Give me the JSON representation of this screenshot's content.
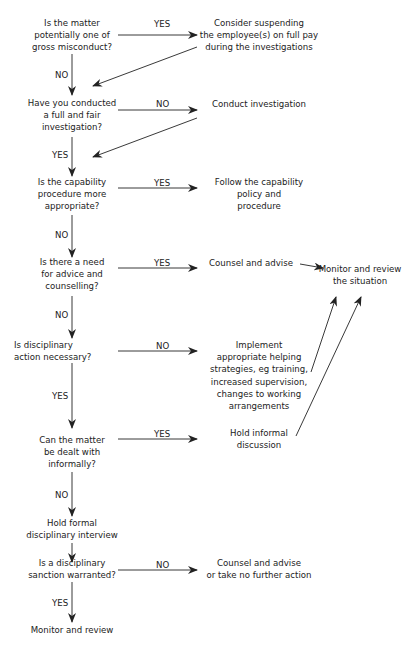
{
  "flowchart": {
    "decisions": [
      {
        "id": "q1",
        "text": "Is the matter\npotentially one of\ngross misconduct?"
      },
      {
        "id": "q2",
        "text": "Have you conducted\na full and fair\ninvestigation?"
      },
      {
        "id": "q3",
        "text": "Is the capability\nprocedure more\nappropriate?"
      },
      {
        "id": "q4",
        "text": "Is there a need\nfor advice and\ncounselling?"
      },
      {
        "id": "q5",
        "text": "Is disciplinary\naction necessary?"
      },
      {
        "id": "q6",
        "text": "Can the matter\nbe dealt with\ninformally?"
      },
      {
        "id": "q7",
        "text": "Is a disciplinary\nsanction warranted?"
      }
    ],
    "actions": [
      {
        "id": "a1",
        "text": "Consider suspending\nthe employee(s) on full pay\nduring the investigations"
      },
      {
        "id": "a2",
        "text": "Conduct investigation"
      },
      {
        "id": "a3",
        "text": "Follow the capability\npolicy and\nprocedure"
      },
      {
        "id": "a4",
        "text": "Counsel and advise"
      },
      {
        "id": "a5",
        "text": "Implement\nappropriate helping\nstrategies, eg training,\nincreased supervision,\nchanges to working\narrangements"
      },
      {
        "id": "a6",
        "text": "Hold informal\ndiscussion"
      },
      {
        "id": "a7",
        "text": "Hold formal\ndisciplinary interview"
      },
      {
        "id": "a8",
        "text": "Counsel and advise\nor take no further action"
      },
      {
        "id": "a9",
        "text": "Monitor and review"
      },
      {
        "id": "m1",
        "text": "Monitor and review\nthe situation"
      }
    ],
    "edge_labels": {
      "q1_yes": "YES",
      "q1_no": "NO",
      "q2_no": "NO",
      "q2_yes": "YES",
      "q3_yes": "YES",
      "q3_no": "NO",
      "q4_yes": "YES",
      "q4_no": "NO",
      "q5_no": "NO",
      "q5_yes": "YES",
      "q6_yes": "YES",
      "q6_no": "NO",
      "q7_no": "NO",
      "q7_yes": "YES"
    },
    "colors": {
      "line": "#222222",
      "text": "#222222",
      "background": "#ffffff"
    }
  }
}
